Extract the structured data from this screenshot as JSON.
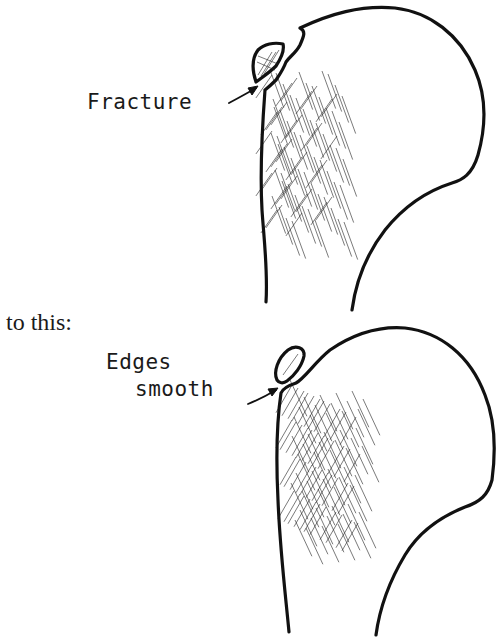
{
  "figure": {
    "panels": [
      {
        "id": "before",
        "label": "Fracture",
        "description": "Bone head with fractured fragment"
      },
      {
        "id": "after",
        "transition_text": "to this:",
        "label_line1": "Edges",
        "label_line2": "smooth",
        "description": "Bone head with smoothed fragment edges"
      }
    ],
    "colors": {
      "ink": "#111111",
      "background": "#ffffff"
    }
  }
}
